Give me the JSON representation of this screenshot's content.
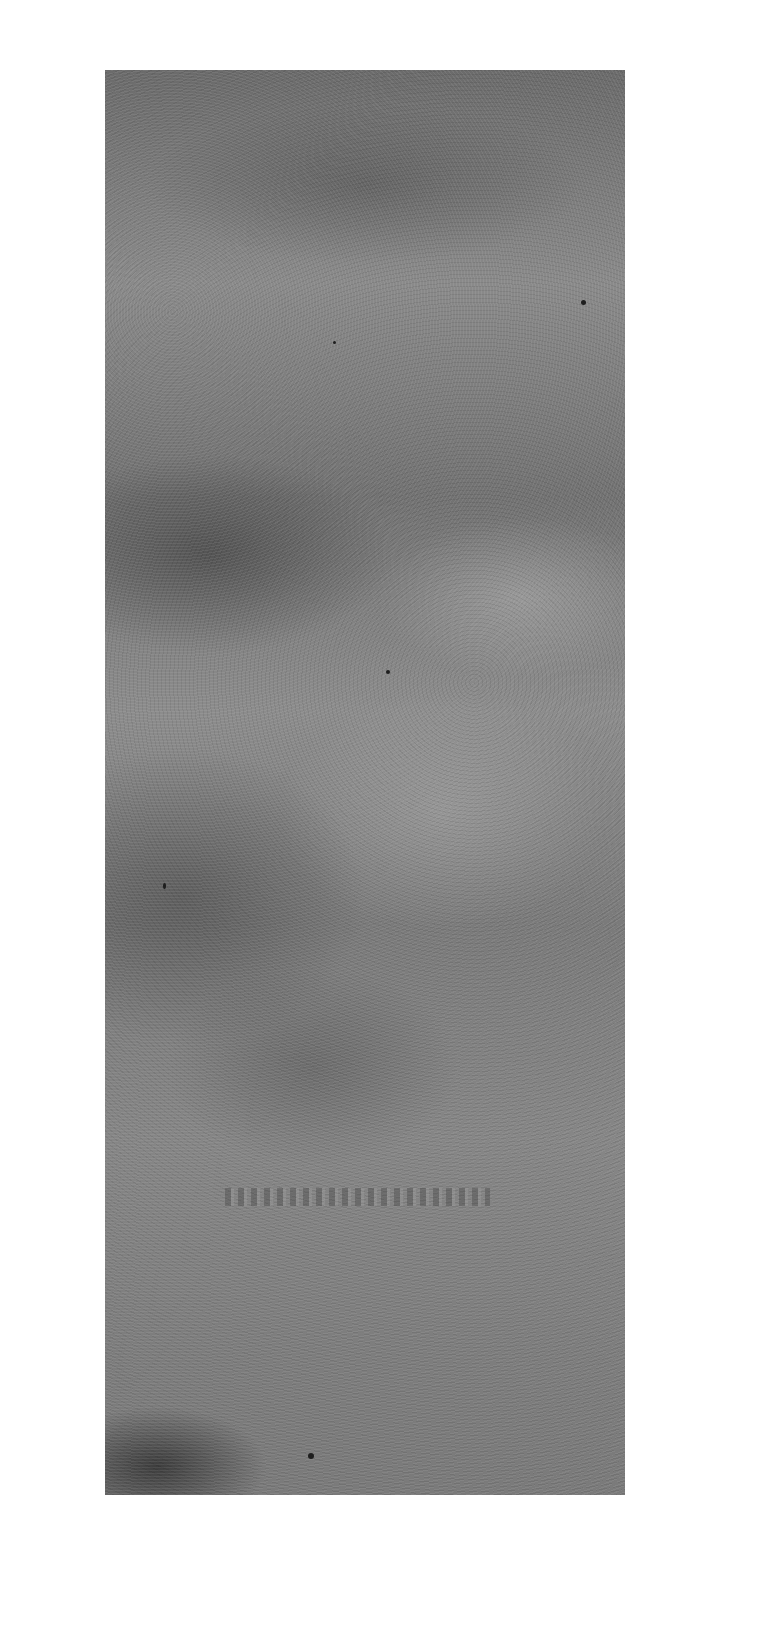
{
  "image": {
    "description": "Grayscale scanned textured panel with mottled light and dark patches on white background",
    "background_color": "#ffffff",
    "panel_base_color": "#808080",
    "embossed_text": ""
  }
}
